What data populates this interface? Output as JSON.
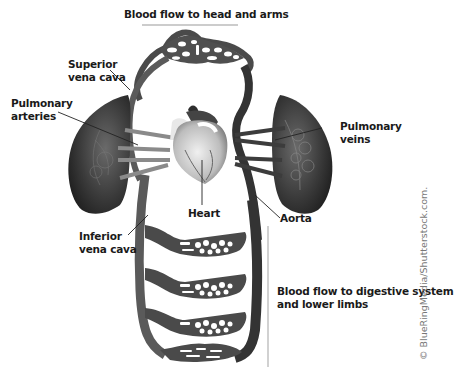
{
  "diagram": {
    "labels": {
      "head_arms": "Blood flow to head and arms",
      "superior_vena_cava": [
        "Superior",
        "vena cava"
      ],
      "pulmonary_arteries": [
        "Pulmonary",
        "arteries"
      ],
      "pulmonary_veins": [
        "Pulmonary",
        "veins"
      ],
      "heart": "Heart",
      "aorta": "Aorta",
      "inferior_vena_cava": [
        "Inferior",
        "vena cava"
      ],
      "digestive_lower": [
        "Blood flow to digestive system",
        "and lower limbs"
      ]
    },
    "credit": "© BlueRingMedia/Shutterstock.com.",
    "colors": {
      "vessel": "#5a5a5a",
      "vessel_dark": "#333333",
      "lung": "#2e2e2e",
      "heart": "#cfcfcf",
      "text": "#1a1a1a",
      "leader": "#222222"
    }
  }
}
